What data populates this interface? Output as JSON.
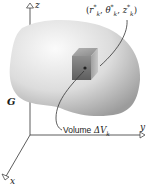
{
  "figure": {
    "type": "3D region with volume element",
    "axes": {
      "z": "z",
      "y": "y",
      "x": "x"
    },
    "region_label": "G",
    "point_label": {
      "r": "r",
      "theta": "θ",
      "z": "z",
      "sub": "k",
      "sup": "*"
    },
    "volume_label": {
      "word": "Volume",
      "symbol": "ΔV",
      "sub": "k"
    },
    "colors": {
      "axis": "#333333",
      "region_light": "#f2f2f2",
      "region_dark": "#a8a8a8",
      "cube": "#7a7a7a"
    }
  }
}
